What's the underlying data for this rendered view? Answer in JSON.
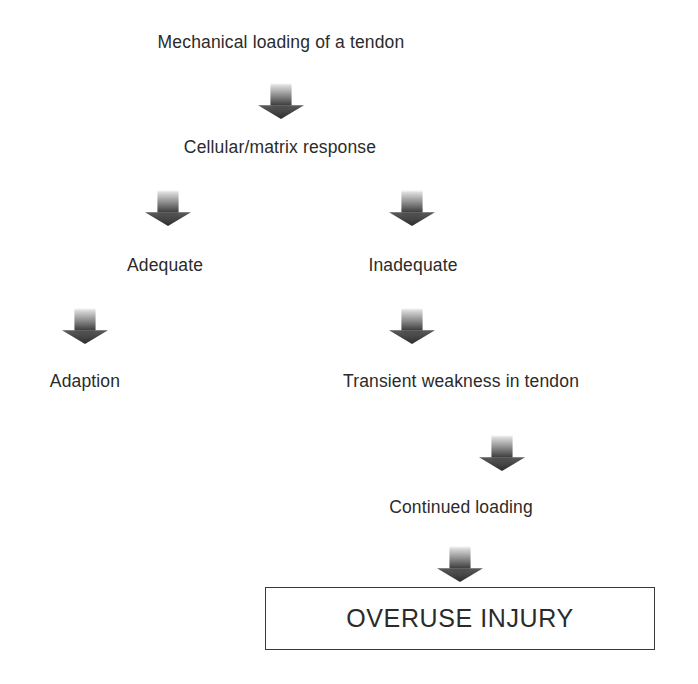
{
  "diagram": {
    "title": "Mechanical loading of a tendon",
    "type": "flowchart",
    "canvas": {
      "width": 698,
      "height": 684,
      "background": "#ffffff"
    },
    "text_color": "#2b2b2b",
    "arrow_color_light": "#d9d9d9",
    "arrow_color_dark": "#3d3d3d",
    "nodes": [
      {
        "id": "n1",
        "label": "Mechanical loading of a tendon",
        "x": 281,
        "y": 42,
        "style": "plain"
      },
      {
        "id": "n2",
        "label": "Cellular/matrix response",
        "x": 280,
        "y": 147,
        "style": "plain"
      },
      {
        "id": "n3",
        "label": "Adequate",
        "x": 165,
        "y": 265,
        "style": "plain"
      },
      {
        "id": "n4",
        "label": "Inadequate",
        "x": 413,
        "y": 265,
        "style": "plain"
      },
      {
        "id": "n5",
        "label": "Adaption",
        "x": 85,
        "y": 381,
        "style": "plain"
      },
      {
        "id": "n6",
        "label": "Transient weakness in tendon",
        "x": 461,
        "y": 381,
        "style": "plain"
      },
      {
        "id": "n7",
        "label": "Continued loading",
        "x": 461,
        "y": 507,
        "style": "plain"
      },
      {
        "id": "n8",
        "label": "OVERUSE INJURY",
        "x": 460,
        "y": 618,
        "style": "boxed"
      }
    ],
    "arrows": [
      {
        "id": "a1",
        "from": "n1",
        "to": "n2",
        "x": 281,
        "y": 83,
        "w": 46,
        "h": 36
      },
      {
        "id": "a2",
        "from": "n2",
        "to": "n3",
        "x": 168,
        "y": 190,
        "w": 46,
        "h": 36
      },
      {
        "id": "a3",
        "from": "n2",
        "to": "n4",
        "x": 412,
        "y": 190,
        "w": 46,
        "h": 36
      },
      {
        "id": "a4",
        "from": "n3",
        "to": "n5",
        "x": 85,
        "y": 308,
        "w": 46,
        "h": 36
      },
      {
        "id": "a5",
        "from": "n4",
        "to": "n6",
        "x": 412,
        "y": 308,
        "w": 46,
        "h": 36
      },
      {
        "id": "a6",
        "from": "n6",
        "to": "n7",
        "x": 502,
        "y": 435,
        "w": 46,
        "h": 36
      },
      {
        "id": "a7",
        "from": "n7",
        "to": "n8",
        "x": 460,
        "y": 546,
        "w": 46,
        "h": 36
      }
    ],
    "terminal_box": {
      "x": 265,
      "y": 587,
      "width": 390,
      "height": 63,
      "border_color": "#3a3a3a"
    }
  }
}
